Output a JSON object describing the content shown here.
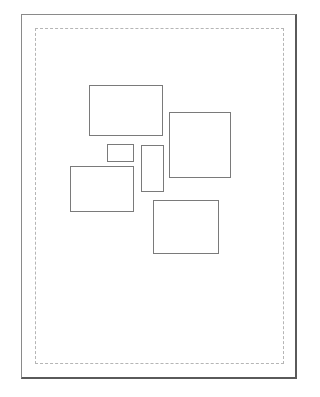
{
  "diagram": {
    "type": "page-layout-wireframe",
    "page": {
      "name": "page-frame"
    },
    "margin_guide": {
      "name": "margin-guide",
      "style": "dashed"
    },
    "blocks": [
      {
        "id": "b1",
        "name": "content-block-top-left"
      },
      {
        "id": "b2",
        "name": "content-block-right"
      },
      {
        "id": "b3",
        "name": "content-block-small"
      },
      {
        "id": "b4",
        "name": "content-block-tall"
      },
      {
        "id": "b5",
        "name": "content-block-bottom-left"
      },
      {
        "id": "b6",
        "name": "content-block-bottom-right"
      }
    ],
    "colors": {
      "frame": "#8a8a8a",
      "frame_shadow": "#5a5a5a",
      "guide": "#b5b5b5",
      "block_border": "#7a7a7a",
      "background": "#ffffff"
    }
  }
}
